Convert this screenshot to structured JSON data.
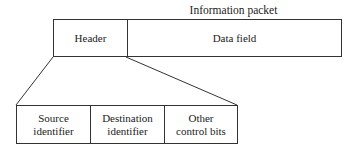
{
  "diagram": {
    "title": "Information packet",
    "packet": {
      "fields": [
        {
          "label": "Header"
        },
        {
          "label": "Data field"
        }
      ]
    },
    "header_expansion": {
      "fields": [
        {
          "label": "Source identifier",
          "line1": "Source",
          "line2": "identifier"
        },
        {
          "label": "Destination identifier",
          "line1": "Destination",
          "line2": "identifier"
        },
        {
          "label": "Other control bits",
          "line1": "Other",
          "line2": "control bits"
        }
      ]
    },
    "colors": {
      "stroke": "#333333",
      "text": "#222222",
      "background": "#ffffff"
    }
  }
}
